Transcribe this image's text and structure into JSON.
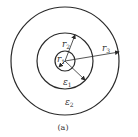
{
  "figure": {
    "caption": "(a)",
    "center": [
      65,
      61
    ],
    "circles": [
      {
        "name": "outer",
        "radius_px": 54
      },
      {
        "name": "middle",
        "radius_px": 28
      },
      {
        "name": "inner",
        "radius_px": 10
      }
    ],
    "radii_labels": [
      {
        "symbol": "r",
        "sub": "1"
      },
      {
        "symbol": "r",
        "sub": "2"
      },
      {
        "symbol": "r",
        "sub": "3"
      }
    ],
    "region_labels": [
      {
        "symbol": "ε",
        "sub": "1"
      },
      {
        "symbol": "ε",
        "sub": "2"
      }
    ],
    "stroke_color": "#2a2a2a",
    "background": "#ffffff"
  }
}
